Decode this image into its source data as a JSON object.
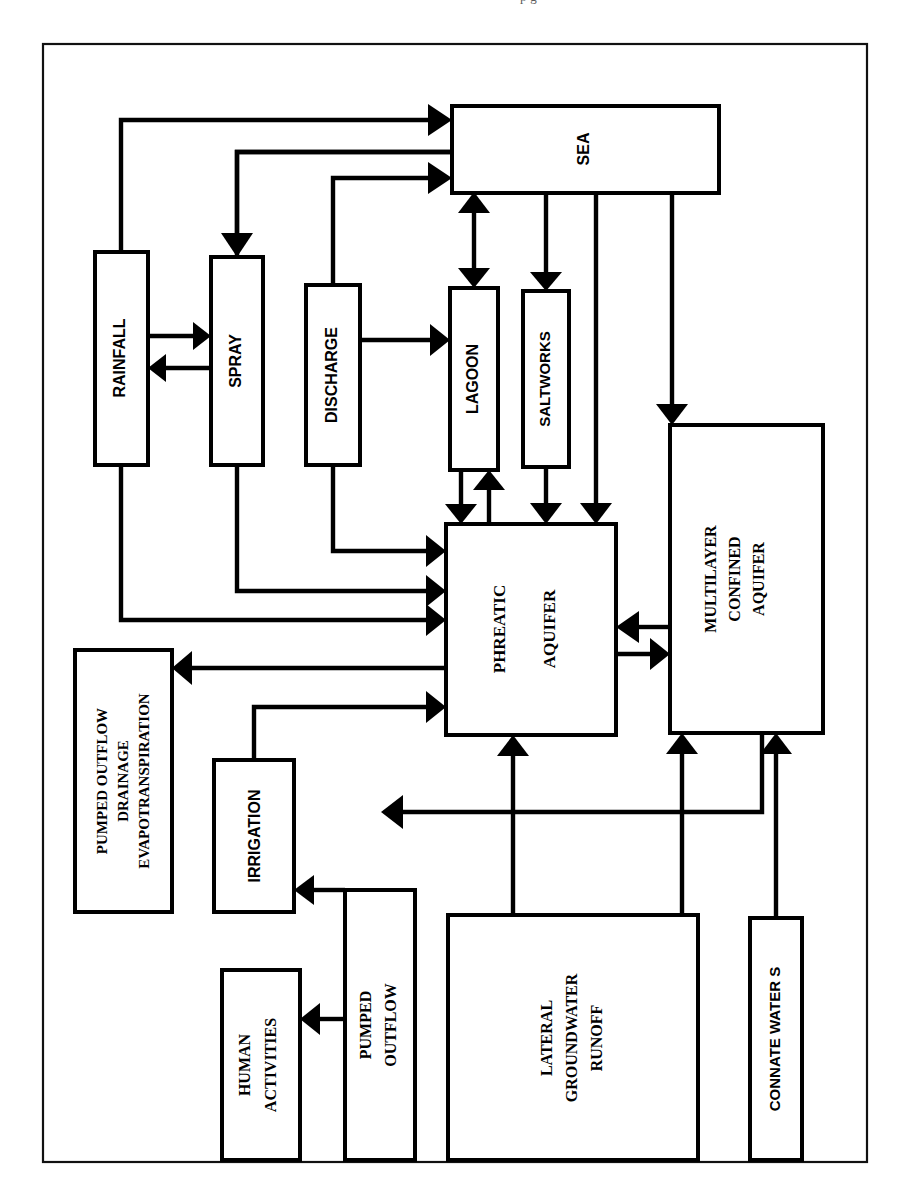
{
  "page": {
    "cut_text_top": "p       g",
    "frame": {
      "x": 43,
      "y": 44,
      "w": 824,
      "h": 1118
    }
  },
  "diagram": {
    "orientation": "rotated-90 (labels read bottom-to-top)",
    "nodes": [
      {
        "id": "sea",
        "label": "SEA",
        "font": "sans",
        "lines": [
          "SEA"
        ],
        "x": 452,
        "y": 106,
        "w": 267,
        "h": 87
      },
      {
        "id": "rainfall",
        "label": "RAINFALL",
        "font": "sans",
        "lines": [
          "RAINFALL"
        ],
        "x": 95,
        "y": 252,
        "w": 53,
        "h": 213
      },
      {
        "id": "spray",
        "label": "SPRAY",
        "font": "sans",
        "lines": [
          "SPRAY"
        ],
        "x": 211,
        "y": 257,
        "w": 52,
        "h": 208
      },
      {
        "id": "discharge",
        "label": "DISCHARGE",
        "font": "sans",
        "lines": [
          "DISCHARGE"
        ],
        "x": 306,
        "y": 285,
        "w": 54,
        "h": 180
      },
      {
        "id": "lagoon",
        "label": "LAGOON",
        "font": "sans",
        "lines": [
          "LAGOON"
        ],
        "x": 450,
        "y": 288,
        "w": 48,
        "h": 182
      },
      {
        "id": "saltworks",
        "label": "SALTWORKS",
        "font": "sans",
        "lines": [
          "SALTWORKS"
        ],
        "x": 523,
        "y": 291,
        "w": 46,
        "h": 176
      },
      {
        "id": "phreatic",
        "label": "PHREATIC AQUIFER",
        "font": "serif",
        "lines": [
          "PHREATIC",
          "AQUIFER"
        ],
        "x": 446,
        "y": 524,
        "w": 170,
        "h": 211
      },
      {
        "id": "multilayer",
        "label": "MULTILAYER CONFINED AQUIFER",
        "font": "serif",
        "lines": [
          "MULTILAYER",
          "CONFINED",
          "AQUIFER"
        ],
        "x": 670,
        "y": 425,
        "w": 153,
        "h": 308
      },
      {
        "id": "outflows",
        "label": "PUMPED OUTFLOW DRAINAGE EVAPOTRANSPIRATION",
        "font": "serif",
        "lines": [
          "PUMPED OUTFLOW",
          "DRAINAGE",
          "EVAPOTRANSPIRATION"
        ],
        "x": 75,
        "y": 650,
        "w": 97,
        "h": 262
      },
      {
        "id": "irrigation",
        "label": "IRRIGATION",
        "font": "sans",
        "lines": [
          "IRRIGATION"
        ],
        "x": 214,
        "y": 760,
        "w": 80,
        "h": 152
      },
      {
        "id": "pumped",
        "label": "PUMPED OUTFLOW",
        "font": "serif",
        "lines": [
          "PUMPED",
          "OUTFLOW"
        ],
        "x": 345,
        "y": 890,
        "w": 70,
        "h": 270
      },
      {
        "id": "human",
        "label": "HUMAN ACTIVITIES",
        "font": "serif",
        "lines": [
          "HUMAN",
          "ACTIVITIES"
        ],
        "x": 222,
        "y": 970,
        "w": 78,
        "h": 190
      },
      {
        "id": "lateral",
        "label": "LATERAL GROUNDWATER RUNOFF",
        "font": "serif",
        "lines": [
          "LATERAL",
          "GROUNDWATER",
          "RUNOFF"
        ],
        "x": 448,
        "y": 915,
        "w": 250,
        "h": 245
      },
      {
        "id": "connate",
        "label": "CONNATE WATER S",
        "font": "sans",
        "lines": [
          "CONNATE WATER S"
        ],
        "x": 750,
        "y": 918,
        "w": 52,
        "h": 242
      }
    ],
    "edges": [
      {
        "from": "rainfall",
        "to": "sea",
        "kind": "directed"
      },
      {
        "from": "spray",
        "to": "sea",
        "kind": "plain"
      },
      {
        "from": "sea",
        "to": "spray",
        "kind": "directed"
      },
      {
        "from": "discharge",
        "to": "sea",
        "kind": "directed"
      },
      {
        "from": "rainfall",
        "to": "spray",
        "kind": "directed"
      },
      {
        "from": "spray",
        "to": "rainfall",
        "kind": "directed"
      },
      {
        "from": "discharge",
        "to": "lagoon",
        "kind": "directed"
      },
      {
        "from": "sea",
        "to": "lagoon",
        "kind": "bidirectional"
      },
      {
        "from": "sea",
        "to": "saltworks",
        "kind": "directed"
      },
      {
        "from": "sea",
        "to": "phreatic",
        "kind": "directed"
      },
      {
        "from": "sea",
        "to": "multilayer",
        "kind": "directed"
      },
      {
        "from": "lagoon",
        "to": "phreatic",
        "kind": "directed"
      },
      {
        "from": "phreatic",
        "to": "lagoon",
        "kind": "directed"
      },
      {
        "from": "saltworks",
        "to": "phreatic",
        "kind": "directed"
      },
      {
        "from": "discharge",
        "to": "phreatic",
        "kind": "directed"
      },
      {
        "from": "spray",
        "to": "phreatic",
        "kind": "directed"
      },
      {
        "from": "rainfall",
        "to": "phreatic",
        "kind": "directed"
      },
      {
        "from": "phreatic",
        "to": "outflows",
        "kind": "directed"
      },
      {
        "from": "irrigation",
        "to": "phreatic",
        "kind": "directed"
      },
      {
        "from": "phreatic",
        "to": "multilayer",
        "kind": "directed"
      },
      {
        "from": "multilayer",
        "to": "phreatic",
        "kind": "directed"
      },
      {
        "from": "lateral",
        "to": "phreatic",
        "kind": "directed"
      },
      {
        "from": "lateral",
        "to": "multilayer",
        "kind": "directed"
      },
      {
        "from": "connate",
        "to": "multilayer",
        "kind": "directed"
      },
      {
        "from": "multilayer",
        "to": "left-outflow",
        "kind": "directed"
      },
      {
        "from": "pumped",
        "to": "irrigation",
        "kind": "directed"
      },
      {
        "from": "pumped",
        "to": "human",
        "kind": "directed"
      }
    ]
  },
  "colors": {
    "ink": "#000000",
    "paper": "#ffffff",
    "frame": "#111111"
  }
}
